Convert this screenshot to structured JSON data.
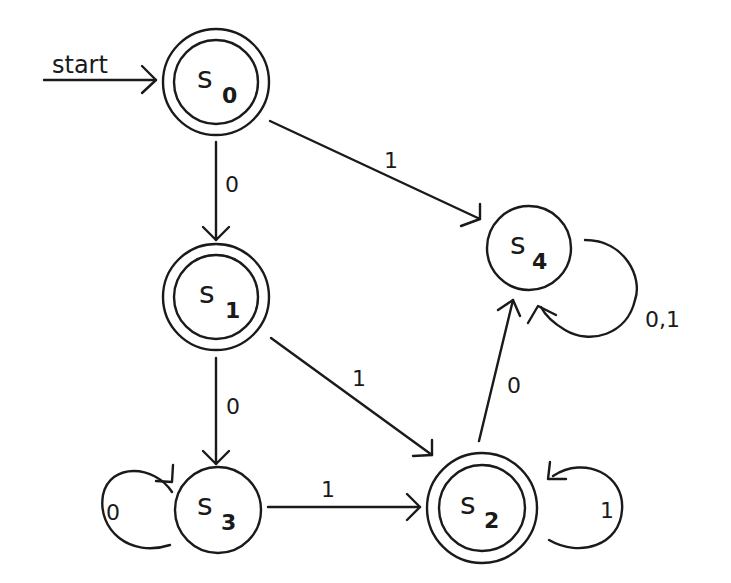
{
  "diagram": {
    "type": "finite-state-automaton",
    "start_label": "start",
    "start_state": "s0",
    "colors": {
      "ink": "#1a1a1a",
      "background": "#ffffff"
    },
    "states": [
      {
        "id": "s0",
        "main": "s",
        "sub": "0",
        "accepting": true,
        "cx": 216,
        "cy": 82
      },
      {
        "id": "s1",
        "main": "s",
        "sub": "1",
        "accepting": true,
        "cx": 216,
        "cy": 297
      },
      {
        "id": "s2",
        "main": "s",
        "sub": "2",
        "accepting": true,
        "cx": 482,
        "cy": 508
      },
      {
        "id": "s3",
        "main": "s",
        "sub": "3",
        "accepting": false,
        "cx": 218,
        "cy": 510
      },
      {
        "id": "s4",
        "main": "s",
        "sub": "4",
        "accepting": false,
        "cx": 529,
        "cy": 248
      }
    ],
    "transitions": [
      {
        "from": "s0",
        "to": "s1",
        "label": "0"
      },
      {
        "from": "s0",
        "to": "s4",
        "label": "1"
      },
      {
        "from": "s1",
        "to": "s3",
        "label": "0"
      },
      {
        "from": "s1",
        "to": "s2",
        "label": "1"
      },
      {
        "from": "s3",
        "to": "s3",
        "label": "0"
      },
      {
        "from": "s3",
        "to": "s2",
        "label": "1"
      },
      {
        "from": "s2",
        "to": "s2",
        "label": "1"
      },
      {
        "from": "s2",
        "to": "s4",
        "label": "0"
      },
      {
        "from": "s4",
        "to": "s4",
        "label": "0,1"
      }
    ]
  }
}
